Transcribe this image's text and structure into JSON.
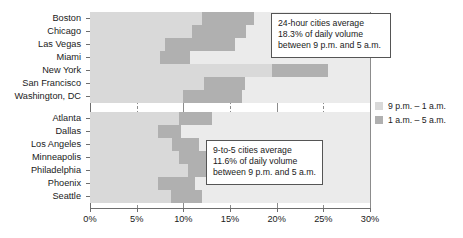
{
  "chart_data": {
    "type": "bar",
    "title": "",
    "subtitle": "",
    "xlabel": "",
    "ylabel": "",
    "xlim": [
      0,
      30
    ],
    "grid": true,
    "orientation": "horizontal",
    "stacked": true,
    "legend_position": "right",
    "categories": [
      "Boston",
      "Chicago",
      "Las Vegas",
      "Miami",
      "New York",
      "San Francisco",
      "Washington, DC",
      "Atlanta",
      "Dallas",
      "Los Angeles",
      "Minneapolis",
      "Philadelphia",
      "Phoenix",
      "Seattle"
    ],
    "groups": [
      {
        "name": "24-hour cities",
        "categories": [
          "Boston",
          "Chicago",
          "Las Vegas",
          "Miami",
          "New York",
          "San Francisco",
          "Washington, DC"
        ]
      },
      {
        "name": "9-to-5 cities",
        "categories": [
          "Atlanta",
          "Dallas",
          "Los Angeles",
          "Minneapolis",
          "Philadelphia",
          "Phoenix",
          "Seattle"
        ]
      }
    ],
    "series": [
      {
        "name": "9 p.m. – 1 a.m.",
        "color": "#d9d9d9",
        "values": [
          12.0,
          10.9,
          8.0,
          7.5,
          19.5,
          12.2,
          10.0,
          9.5,
          7.3,
          8.8,
          9.5,
          10.5,
          7.3,
          8.7
        ]
      },
      {
        "name": "1 a.m. – 5 a.m.",
        "color": "#b0b0b0",
        "values": [
          5.6,
          5.8,
          7.5,
          3.2,
          6.0,
          4.4,
          6.3,
          3.6,
          2.5,
          2.9,
          3.6,
          3.3,
          3.9,
          3.3
        ]
      }
    ],
    "totals": [
      17.6,
      16.7,
      15.5,
      10.7,
      25.5,
      16.6,
      16.3,
      13.1,
      9.8,
      11.7,
      13.1,
      13.8,
      11.2,
      12.0
    ],
    "xticks": [
      0,
      5,
      10,
      15,
      20,
      25,
      30
    ],
    "xtick_labels": [
      "0%",
      "5%",
      "10%",
      "15%",
      "20%",
      "25%",
      "30%"
    ],
    "annotations": [
      {
        "id": "24-hour",
        "lines": [
          "24-hour cities average",
          "18.3% of daily volume",
          "between 9 p.m. and 5 a.m."
        ]
      },
      {
        "id": "9-to-5",
        "lines": [
          "9-to-5 cities average",
          "11.6% of daily volume",
          "between 9 p.m. and 5 a.m."
        ]
      }
    ]
  },
  "legend": {
    "items": [
      {
        "label": "9 p.m. – 1 a.m.",
        "color": "#d9d9d9",
        "swatch": "light"
      },
      {
        "label": "1 a.m. – 5 a.m.",
        "color": "#b0b0b0",
        "swatch": "dark"
      }
    ]
  },
  "colors": {
    "series_light": "#d9d9d9",
    "series_dark": "#b0b0b0",
    "track": "#ebebeb",
    "axis": "#6e6e6e",
    "grid": "#8c8c8c",
    "callout_border": "#555555",
    "text": "#1a1a1a",
    "background": "#ffffff"
  }
}
